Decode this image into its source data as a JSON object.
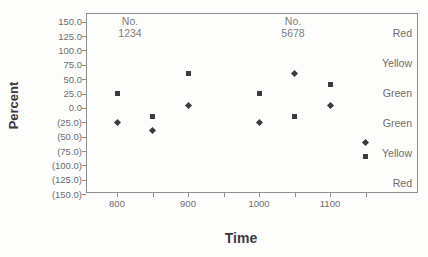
{
  "figure": {
    "x_axis_title": "Time",
    "y_axis_title": "Percent"
  },
  "chart_data": {
    "type": "scatter",
    "title": "",
    "xlabel": "Time",
    "ylabel": "Percent",
    "grid": false,
    "legend": "none",
    "background_color": "#fdfdfc",
    "marker_color": "#3c3c3c",
    "axis_line_color": "#8f8f8f",
    "xlim": [
      756,
      1224
    ],
    "ylim": [
      -148,
      165
    ],
    "x_ticks": [
      800,
      850,
      900,
      950,
      1000,
      1050,
      1100,
      1150
    ],
    "x_tick_labels": [
      "800",
      "900",
      "1000",
      "1100"
    ],
    "x_labeled_ticks": [
      800,
      900,
      1000,
      1100
    ],
    "y_ticks": [
      150,
      125,
      100,
      75,
      50,
      25,
      0,
      -25,
      -50,
      -75,
      -100,
      -125,
      -150
    ],
    "y_tick_labels": [
      "150.0",
      "125.0",
      "100.0",
      "75.0",
      "50.0",
      "25.0",
      "0.0",
      "(25.0)",
      "(50.0)",
      "(75.0)",
      "(100.0)",
      "(125.0)",
      "(150.0)"
    ],
    "series": [
      {
        "name": "square-series",
        "marker": "square",
        "points": [
          [
            800,
            25
          ],
          [
            850,
            -15
          ],
          [
            900,
            60
          ],
          [
            1000,
            25
          ],
          [
            1050,
            -15
          ],
          [
            1100,
            40
          ],
          [
            1150,
            -85
          ]
        ]
      },
      {
        "name": "diamond-series",
        "marker": "diamond",
        "points": [
          [
            800,
            -25
          ],
          [
            850,
            -40
          ],
          [
            900,
            5
          ],
          [
            1000,
            -25
          ],
          [
            1050,
            60
          ],
          [
            1100,
            5
          ],
          [
            1150,
            -60
          ]
        ]
      }
    ],
    "annotations": [
      {
        "line1": "No.",
        "line2": "1234",
        "x": 818
      },
      {
        "line1": "No.",
        "line2": "5678",
        "x": 1048
      }
    ],
    "zone_labels": [
      {
        "label": "Red",
        "y": 130
      },
      {
        "label": "Yellow",
        "y": 78
      },
      {
        "label": "Green",
        "y": 26
      },
      {
        "label": "Green",
        "y": -26
      },
      {
        "label": "Yellow",
        "y": -78
      },
      {
        "label": "Red",
        "y": -130
      }
    ]
  }
}
